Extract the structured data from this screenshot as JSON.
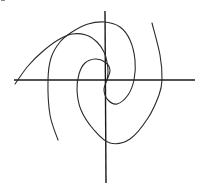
{
  "chart_data": {
    "type": "line",
    "title": "",
    "xlabel": "",
    "ylabel": "",
    "grid": false,
    "legend": null,
    "axes": {
      "x_axis": {
        "from_px": [
          14,
          80
        ],
        "to_px": [
          195,
          80
        ]
      },
      "y_axis": {
        "from_px": [
          105,
          11
        ],
        "to_px": [
          106,
          183
        ]
      },
      "origin_px": [
        106,
        80
      ]
    },
    "series": [
      {
        "name": "spiral-arm-1",
        "points_px": [
          [
            15,
            84
          ],
          [
            28,
            66
          ],
          [
            42,
            52
          ],
          [
            58,
            40
          ],
          [
            72,
            34
          ],
          [
            86,
            35
          ],
          [
            97,
            42
          ],
          [
            104,
            52
          ],
          [
            107,
            62
          ],
          [
            108,
            72
          ],
          [
            107,
            80
          ]
        ]
      },
      {
        "name": "spiral-arm-2",
        "points_px": [
          [
            58,
            140
          ],
          [
            50,
            115
          ],
          [
            48,
            80
          ],
          [
            51,
            58
          ],
          [
            60,
            42
          ],
          [
            72,
            32
          ],
          [
            88,
            24
          ],
          [
            105,
            22
          ],
          [
            120,
            27
          ],
          [
            130,
            40
          ],
          [
            135,
            60
          ],
          [
            134,
            80
          ],
          [
            128,
            95
          ],
          [
            117,
            104
          ],
          [
            108,
            100
          ],
          [
            104,
            90
          ],
          [
            107,
            80
          ]
        ]
      },
      {
        "name": "spiral-arm-3",
        "points_px": [
          [
            107,
            80
          ],
          [
            110,
            70
          ],
          [
            105,
            62
          ],
          [
            95,
            59
          ],
          [
            85,
            63
          ],
          [
            79,
            74
          ],
          [
            77,
            90
          ],
          [
            81,
            110
          ],
          [
            94,
            130
          ],
          [
            110,
            143
          ],
          [
            130,
            139
          ],
          [
            148,
            118
          ],
          [
            159,
            95
          ],
          [
            162,
            80
          ],
          [
            160,
            55
          ],
          [
            152,
            23
          ]
        ]
      }
    ],
    "axis_crossings_px": {
      "x_axis": [
        48,
        77,
        106,
        134,
        162
      ],
      "y_axis": [
        22,
        60,
        80,
        104,
        142
      ]
    }
  },
  "colors": {
    "background": "#ffffff",
    "ink": "#2a2a2a"
  }
}
